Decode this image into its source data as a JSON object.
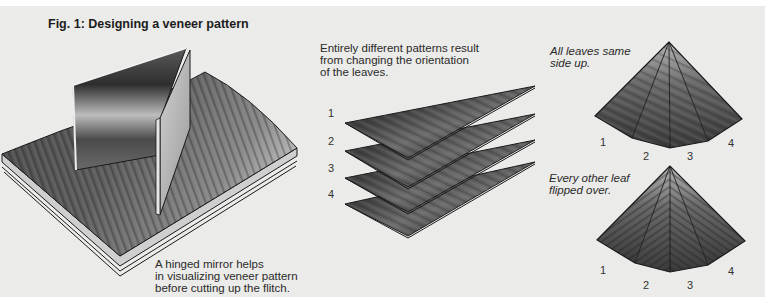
{
  "figure": {
    "title": "Fig. 1: Designing a veneer pattern"
  },
  "mirror_panel": {
    "caption_lines": [
      "A hinged mirror helps",
      "in visualizing veneer pattern",
      "before cutting up the flitch."
    ]
  },
  "leaves_panel": {
    "caption_lines": [
      "Entirely different patterns result",
      "from changing the orientation",
      "of the leaves."
    ],
    "leaf_labels": [
      "1",
      "2",
      "3",
      "4"
    ]
  },
  "patterns": [
    {
      "caption_lines": [
        "All leaves same",
        "side up."
      ],
      "leaf_labels": [
        "1",
        "2",
        "3",
        "4"
      ]
    },
    {
      "caption_lines": [
        "Every other leaf",
        "flipped over."
      ],
      "leaf_labels": [
        "1",
        "2",
        "3",
        "4"
      ]
    }
  ],
  "colors": {
    "paper": "#ebebe9",
    "wood_dark": "#3d3d3d",
    "wood_mid": "#6a6a6a",
    "wood_light": "#a8a8a8",
    "outline": "#1a1a1a"
  }
}
